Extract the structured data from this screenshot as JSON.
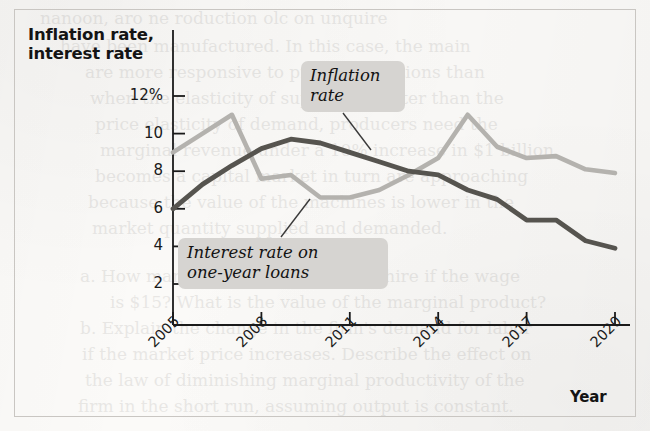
{
  "chart_data": {
    "type": "line",
    "title": "",
    "xlabel": "Year",
    "ylabel": "Inflation rate, interest rate",
    "x": [
      2005,
      2006,
      2007,
      2008,
      2009,
      2010,
      2011,
      2012,
      2013,
      2014,
      2015,
      2016,
      2017,
      2018,
      2019,
      2020
    ],
    "xlim": [
      2005,
      2020
    ],
    "ylim": [
      0,
      12.8
    ],
    "grid": false,
    "legend_position": "inline-annotations",
    "x_tick_labels": [
      "2005",
      "2008",
      "2011",
      "2014",
      "2017",
      "2020"
    ],
    "x_tick_values": [
      2005,
      2008,
      2011,
      2014,
      2017,
      2020
    ],
    "y_tick_labels": [
      "12%",
      "10",
      "8",
      "6",
      "4",
      "2"
    ],
    "y_tick_values": [
      12,
      10,
      8,
      6,
      4,
      2
    ],
    "series": [
      {
        "name": "Inflation rate",
        "color": "#b4b2ae",
        "values": [
          9.0,
          10.0,
          11.0,
          7.6,
          7.8,
          6.6,
          6.6,
          7.0,
          7.8,
          8.7,
          11.0,
          9.3,
          8.7,
          8.8,
          8.1,
          7.9
        ]
      },
      {
        "name": "Interest rate on one-year loans",
        "color": "#56544f",
        "values": [
          6.0,
          7.3,
          8.3,
          9.2,
          9.7,
          9.5,
          9.0,
          8.5,
          8.0,
          7.8,
          7.0,
          6.5,
          5.4,
          5.4,
          4.3,
          3.9
        ]
      }
    ],
    "annotations": [
      {
        "id": "inflation",
        "text": "Inflation\nrate",
        "target_year": 2012.1,
        "target_value": 8.55
      },
      {
        "id": "interest",
        "text": "Interest rate on\none-year loans",
        "target_year": 2009.9,
        "target_value": 6.75
      }
    ]
  },
  "axes": {
    "y_title": "Inflation rate,\ninterest rate",
    "x_title": "Year"
  },
  "colors": {
    "inflation_line": "#b4b2ae",
    "interest_line": "#56544f",
    "axis": "#1a1a1a",
    "label_box": "#d6d4d1",
    "frame_border": "#c9c6c2",
    "page_background": "#fbfaf8"
  }
}
